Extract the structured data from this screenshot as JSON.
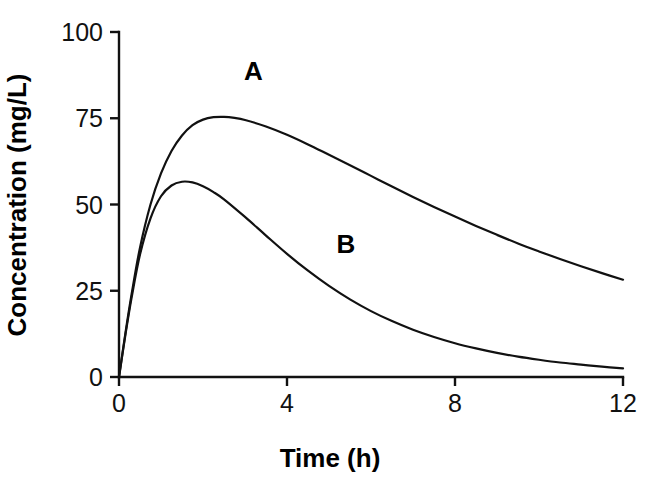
{
  "chart_data": {
    "type": "line",
    "title": "",
    "xlabel": "Time (h)",
    "ylabel": "Concentration  (mg/L)",
    "xlim": [
      0,
      12
    ],
    "ylim": [
      0,
      100
    ],
    "xticks": [
      0,
      4,
      8,
      12
    ],
    "xtick_labels": [
      "0",
      "4",
      "8",
      "12"
    ],
    "yticks": [
      0,
      25,
      50,
      75,
      100
    ],
    "ytick_labels": [
      "0",
      "25",
      "50",
      "75",
      "100"
    ],
    "grid": false,
    "legend_position": "inline-annotations",
    "annotations": [
      {
        "text": "A",
        "x": 3.2,
        "y": 86
      },
      {
        "text": "B",
        "x": 5.4,
        "y": 36
      }
    ],
    "series": [
      {
        "name": "A",
        "color": "#111111",
        "x": [
          0,
          0.15,
          0.3,
          0.5,
          0.75,
          1,
          1.25,
          1.5,
          1.75,
          2,
          2.25,
          2.5,
          2.75,
          3,
          3.5,
          4,
          4.5,
          5,
          5.5,
          6,
          6.5,
          7,
          7.5,
          8,
          8.5,
          9,
          9.5,
          10,
          10.5,
          11,
          11.5,
          12
        ],
        "y": [
          0,
          12.5,
          24.0,
          37.5,
          50.0,
          59.0,
          65.5,
          70.0,
          73.0,
          74.6,
          75.3,
          75.4,
          75.1,
          74.5,
          72.6,
          70.2,
          67.4,
          64.4,
          61.4,
          58.3,
          55.2,
          52.2,
          49.3,
          46.5,
          43.8,
          41.2,
          38.7,
          36.4,
          34.2,
          32.1,
          30.1,
          28.2
        ]
      },
      {
        "name": "B",
        "color": "#111111",
        "x": [
          0,
          0.15,
          0.3,
          0.5,
          0.75,
          1,
          1.25,
          1.5,
          1.75,
          2,
          2.25,
          2.5,
          3,
          3.5,
          4,
          4.5,
          5,
          5.5,
          6,
          6.5,
          7,
          7.5,
          8,
          8.5,
          9,
          9.5,
          10,
          10.5,
          11,
          11.5,
          12
        ],
        "y": [
          0,
          12.0,
          23.0,
          35.5,
          46.0,
          52.4,
          55.5,
          56.6,
          56.4,
          55.3,
          53.6,
          51.5,
          46.4,
          41.0,
          35.7,
          30.8,
          26.4,
          22.5,
          19.1,
          16.2,
          13.7,
          11.6,
          9.8,
          8.3,
          7.0,
          5.9,
          5.0,
          4.2,
          3.6,
          3.0,
          2.5
        ]
      }
    ]
  },
  "plot_geometry": {
    "origin_x": 119,
    "origin_y": 377,
    "x_right": 623,
    "y_top": 32,
    "tick_len": 9
  }
}
